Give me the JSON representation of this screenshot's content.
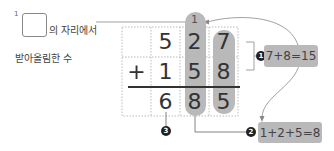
{
  "caption": {
    "superscript": "1",
    "line1_suffix": "의 자리에서",
    "line2": "받아올림한 수"
  },
  "problem": {
    "operator": "+",
    "row1": [
      "",
      "5",
      "2",
      "7"
    ],
    "row2": [
      "+",
      "1",
      "5",
      "8"
    ],
    "result": [
      "",
      "6",
      "8",
      "5"
    ],
    "carry": "1"
  },
  "steps": [
    {
      "badge": "1",
      "text": "7+8=15"
    },
    {
      "badge": "2",
      "text": "1+2+5=8"
    },
    {
      "badge": "3",
      "text": ""
    }
  ],
  "colors": {
    "highlight": "#b9b9b9",
    "badge": "#222222",
    "grid_line": "#bbbbbb",
    "rule": "#333333"
  }
}
